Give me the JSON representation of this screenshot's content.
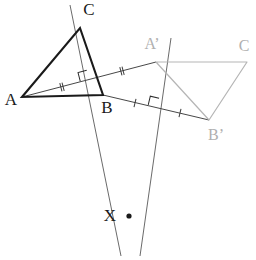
{
  "figure": {
    "background_color": "#ffffff",
    "width": 256,
    "height": 260
  },
  "styles": {
    "primary_stroke": "#1a1a1a",
    "secondary_stroke": "#b5b5b5",
    "construction_stroke": "#595959",
    "label_dark": "#1a1a1a",
    "label_light": "#b0b0b0"
  },
  "labels": {
    "A": "A",
    "B": "B",
    "C": "C",
    "A_prime": "A’",
    "B_prime": "B’",
    "C_prime": "C",
    "X": "X"
  },
  "points": {
    "A": {
      "label": "A",
      "x": 22,
      "y": 97,
      "label_x": 11,
      "label_y": 101,
      "color": "#1a1a1a"
    },
    "B": {
      "label": "B",
      "x": 103,
      "y": 95,
      "label_x": 107,
      "label_y": 109,
      "color": "#1a1a1a"
    },
    "C": {
      "label": "C",
      "x": 80,
      "y": 28,
      "label_x": 89,
      "label_y": 11,
      "color": "#1a1a1a"
    },
    "A_prime": {
      "label": "A’",
      "x": 156,
      "y": 62,
      "label_x": 152,
      "label_y": 45,
      "color": "#b0b0b0"
    },
    "B_prime": {
      "label": "B’",
      "x": 209,
      "y": 120,
      "label_x": 216,
      "label_y": 136,
      "color": "#b0b0b0"
    },
    "C_prime": {
      "label": "C",
      "x": 247,
      "y": 62,
      "label_x": 244,
      "label_y": 47,
      "color": "#b0b0b0"
    },
    "X": {
      "label": "X",
      "x": 129,
      "y": 216,
      "label_x": 110,
      "label_y": 217,
      "color": "#1a1a1a"
    }
  },
  "shapes": {
    "triangle_original": {
      "name": "triangle-ABC",
      "vertices": "22,97 80,28 103,95",
      "stroke": "#1a1a1a",
      "stroke_width": 2.1,
      "fill": "none"
    },
    "triangle_image": {
      "name": "triangle-A-prime-B-prime-C-prime",
      "vertices": "156,62 247,62 209,120",
      "stroke": "#b5b5b5",
      "stroke_width": 1.2,
      "fill": "none"
    }
  },
  "segments": {
    "AA_prime": {
      "name": "segment-A-to-A-prime",
      "x1": 22,
      "y1": 97,
      "x2": 156,
      "y2": 62,
      "stroke": "#3d3d3d",
      "tick_count": 2,
      "tick_label": "double-tick"
    },
    "BB_prime": {
      "name": "segment-B-to-B-prime",
      "x1": 103,
      "y1": 95,
      "x2": 209,
      "y2": 120,
      "stroke": "#3d3d3d",
      "tick_count": 1,
      "tick_label": "single-tick"
    }
  },
  "bisectors": {
    "bisector_AA_prime": {
      "name": "perpendicular-bisector-of-AA-prime",
      "x1": 70,
      "y1": 5,
      "x2": 121,
      "y2": 256,
      "stroke": "#595959",
      "foot_x": 89,
      "foot_y": 80
    },
    "bisector_BB_prime": {
      "name": "perpendicular-bisector-of-BB-prime",
      "x1": 171,
      "y1": 38,
      "x2": 140,
      "y2": 256,
      "stroke": "#595959",
      "foot_x": 157,
      "foot_y": 108
    }
  },
  "tick_marks": [
    {
      "name": "tick-AA-prime-near-A",
      "cx": 62,
      "cy": 87,
      "count": 2,
      "angle": -14.6,
      "color": "#3d3d3d"
    },
    {
      "name": "tick-AA-prime-near-A-prime",
      "cx": 122,
      "cy": 71,
      "count": 2,
      "angle": -14.6,
      "color": "#3d3d3d"
    },
    {
      "name": "tick-BB-prime-near-B",
      "cx": 135,
      "cy": 103,
      "count": 1,
      "angle": 13.3,
      "color": "#3d3d3d"
    },
    {
      "name": "tick-BB-prime-near-B-prime",
      "cx": 180,
      "cy": 113,
      "count": 1,
      "angle": 13.3,
      "color": "#3d3d3d"
    }
  ],
  "right_angles": [
    {
      "name": "right-angle-marker-AA-prime",
      "cx": 89,
      "cy": 79,
      "angle": -14.6,
      "size": 9,
      "color": "#2b2b2b"
    },
    {
      "name": "right-angle-marker-BB-prime",
      "cx": 157,
      "cy": 107,
      "angle": 13.3,
      "size": 9,
      "color": "#2b2b2b"
    }
  ],
  "markers": {
    "intersection_point": {
      "name": "intersection-point-X",
      "cx": 129,
      "cy": 216,
      "r": 2.6,
      "color": "#1a1a1a"
    }
  }
}
